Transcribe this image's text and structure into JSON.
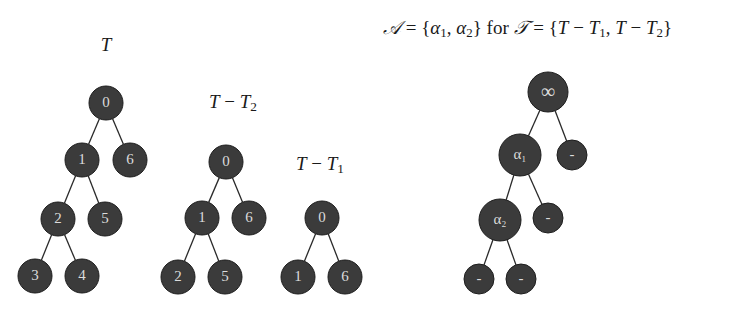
{
  "colors": {
    "background": "#ffffff",
    "node_fill": "#3b3b3b",
    "node_stroke": "#1e1e1e",
    "node_text": "#dcdcdc",
    "edge": "#2a2a2a",
    "label_text": "#1a1a1a"
  },
  "header": {
    "formula": {
      "set_symbol": "𝒜",
      "eq1": " = {",
      "alpha": "α",
      "sub1": "1",
      "comma1": ", ",
      "alpha2": "α",
      "sub2": "2",
      "close1": "} ",
      "for": "for",
      "space": " ",
      "collection_symbol": "𝒯",
      "eq2": " = {",
      "T_a": "T",
      "minus_a": " − ",
      "T1": "T",
      "T1_sub": "1",
      "comma2": ", ",
      "T_b": "T",
      "minus_b": " − ",
      "T2": "T",
      "T2_sub": "2",
      "close2": "}"
    }
  },
  "trees": [
    {
      "id": "T",
      "title": {
        "main": "T",
        "sub": "",
        "minus": "",
        "second": ""
      },
      "title_pos": [
        106,
        45
      ],
      "nodes": [
        {
          "id": "n0",
          "label": "0",
          "x": 106,
          "y": 103,
          "r": 17
        },
        {
          "id": "n1",
          "label": "1",
          "x": 82,
          "y": 160,
          "r": 17
        },
        {
          "id": "n6",
          "label": "6",
          "x": 130,
          "y": 160,
          "r": 17
        },
        {
          "id": "n2",
          "label": "2",
          "x": 58,
          "y": 219,
          "r": 17
        },
        {
          "id": "n5",
          "label": "5",
          "x": 105,
          "y": 219,
          "r": 17
        },
        {
          "id": "n3",
          "label": "3",
          "x": 35,
          "y": 276,
          "r": 17
        },
        {
          "id": "n4",
          "label": "4",
          "x": 82,
          "y": 276,
          "r": 17
        }
      ],
      "edges": [
        [
          "n0",
          "n1"
        ],
        [
          "n0",
          "n6"
        ],
        [
          "n1",
          "n2"
        ],
        [
          "n1",
          "n5"
        ],
        [
          "n2",
          "n3"
        ],
        [
          "n2",
          "n4"
        ]
      ]
    },
    {
      "id": "T-T2",
      "title": {
        "main": "T",
        "minus": " − ",
        "second": "T",
        "sub": "2"
      },
      "title_pos": [
        233,
        103
      ],
      "nodes": [
        {
          "id": "n0",
          "label": "0",
          "x": 226,
          "y": 162,
          "r": 17
        },
        {
          "id": "n1",
          "label": "1",
          "x": 202,
          "y": 218,
          "r": 17
        },
        {
          "id": "n6",
          "label": "6",
          "x": 249,
          "y": 218,
          "r": 17
        },
        {
          "id": "n2",
          "label": "2",
          "x": 178,
          "y": 277,
          "r": 17
        },
        {
          "id": "n5",
          "label": "5",
          "x": 225,
          "y": 277,
          "r": 17
        }
      ],
      "edges": [
        [
          "n0",
          "n1"
        ],
        [
          "n0",
          "n6"
        ],
        [
          "n1",
          "n2"
        ],
        [
          "n1",
          "n5"
        ]
      ]
    },
    {
      "id": "T-T1",
      "title": {
        "main": "T",
        "minus": " − ",
        "second": "T",
        "sub": "1"
      },
      "title_pos": [
        320,
        165
      ],
      "nodes": [
        {
          "id": "n0",
          "label": "0",
          "x": 322,
          "y": 218,
          "r": 17
        },
        {
          "id": "n1",
          "label": "1",
          "x": 298,
          "y": 277,
          "r": 17
        },
        {
          "id": "n6",
          "label": "6",
          "x": 345,
          "y": 277,
          "r": 17
        }
      ],
      "edges": [
        [
          "n0",
          "n1"
        ],
        [
          "n0",
          "n6"
        ]
      ]
    },
    {
      "id": "A",
      "title": null,
      "nodes": [
        {
          "id": "inf",
          "label": "∞",
          "x": 548,
          "y": 92,
          "r": 20
        },
        {
          "id": "a1",
          "label": "α₁",
          "x": 520,
          "y": 155,
          "r": 21
        },
        {
          "id": "d1",
          "label": "-",
          "x": 572,
          "y": 155,
          "r": 15
        },
        {
          "id": "a2",
          "label": "α₂",
          "x": 500,
          "y": 220,
          "r": 21
        },
        {
          "id": "d2",
          "label": "-",
          "x": 548,
          "y": 218,
          "r": 15
        },
        {
          "id": "d3",
          "label": "-",
          "x": 479,
          "y": 279,
          "r": 15
        },
        {
          "id": "d4",
          "label": "-",
          "x": 521,
          "y": 279,
          "r": 15
        }
      ],
      "edges": [
        [
          "inf",
          "a1"
        ],
        [
          "inf",
          "d1"
        ],
        [
          "a1",
          "a2"
        ],
        [
          "a1",
          "d2"
        ],
        [
          "a2",
          "d3"
        ],
        [
          "a2",
          "d4"
        ]
      ]
    }
  ]
}
